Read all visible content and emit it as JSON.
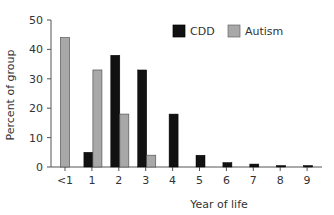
{
  "chart_data": {
    "type": "bar",
    "title": "",
    "xlabel": "Year of life",
    "ylabel": "Percent of group",
    "ylim": [
      0,
      50
    ],
    "yticks": [
      0,
      10,
      20,
      30,
      40,
      50
    ],
    "categories": [
      "<1",
      "1",
      "2",
      "3",
      "4",
      "5",
      "6",
      "7",
      "8",
      "9"
    ],
    "series": [
      {
        "name": "CDD",
        "color": "#111111",
        "values": [
          0,
          5,
          38,
          33,
          18,
          4,
          1.5,
          1,
          0.5,
          0.5
        ]
      },
      {
        "name": "Autism",
        "color": "#a8a8a8",
        "values": [
          44,
          33,
          18,
          4,
          0,
          0,
          0,
          0,
          0,
          0
        ]
      }
    ],
    "legend": {
      "position": "top-right",
      "entries": [
        "CDD",
        "Autism"
      ]
    },
    "grid": false
  }
}
